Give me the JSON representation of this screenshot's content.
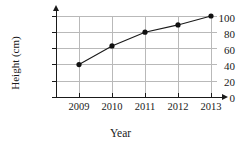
{
  "chart_data": {
    "type": "line",
    "title": "",
    "xlabel": "Year",
    "ylabel": "Height (cm)",
    "categories": [
      "2009",
      "2010",
      "2011",
      "2012",
      "2013"
    ],
    "values": [
      40,
      63,
      80,
      89,
      100
    ],
    "series": [
      {
        "name": "Height",
        "values": [
          40,
          63,
          80,
          89,
          100
        ]
      }
    ],
    "ylim": [
      0,
      100
    ],
    "yticks": [
      0,
      20,
      40,
      60,
      80,
      100
    ],
    "ytick_labels": [
      "0",
      "20",
      "40",
      "60",
      "80",
      "100"
    ],
    "xtick_labels": [
      "2009",
      "2010",
      "2011",
      "2012",
      "2013"
    ],
    "grid": true,
    "grid_axis": "both",
    "legend": false,
    "legend_position": "none",
    "marker": "filled-circle",
    "line_color": "#1a1a1a",
    "grid_color": "#b9b9b9",
    "axis_color": "#1a1a1a",
    "axis_arrows": true,
    "annotations": []
  }
}
